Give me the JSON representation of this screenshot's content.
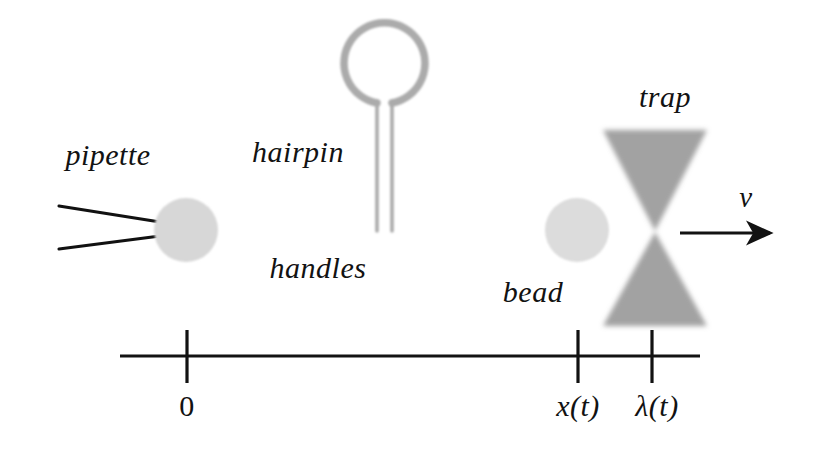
{
  "figure": {
    "background_color": "#ffffff",
    "width": 815,
    "height": 463,
    "labels": {
      "pipette": "pipette",
      "hairpin": "hairpin",
      "handles": "handles",
      "bead": "bead",
      "trap": "trap",
      "velocity": "v"
    },
    "axis": {
      "ticks": [
        {
          "name": "origin",
          "label": "0",
          "x": 187
        },
        {
          "name": "bead-position",
          "label": "x(t)",
          "x": 578
        },
        {
          "name": "trap-position",
          "label": "λ(t)",
          "x": 652
        }
      ],
      "line_y": 356,
      "line_x_start": 120,
      "line_x_end": 700
    },
    "colors": {
      "ink": "#121212",
      "bead_fill": "#d5d5d5",
      "molecule_gray": "#a8a8a8",
      "trap_gray": "#9a9a9a"
    },
    "elements": {
      "left_bead": {
        "cx": 186,
        "cy": 230,
        "r": 32
      },
      "right_bead": {
        "cx": 577,
        "cy": 230,
        "r": 32
      },
      "hairpin_loop": {
        "cx": 384,
        "cy": 67,
        "r": 40
      },
      "trap_waist": {
        "x": 655,
        "y": 231
      },
      "velocity_arrow": {
        "x_start": 680,
        "x_end": 774,
        "y": 233
      }
    }
  }
}
